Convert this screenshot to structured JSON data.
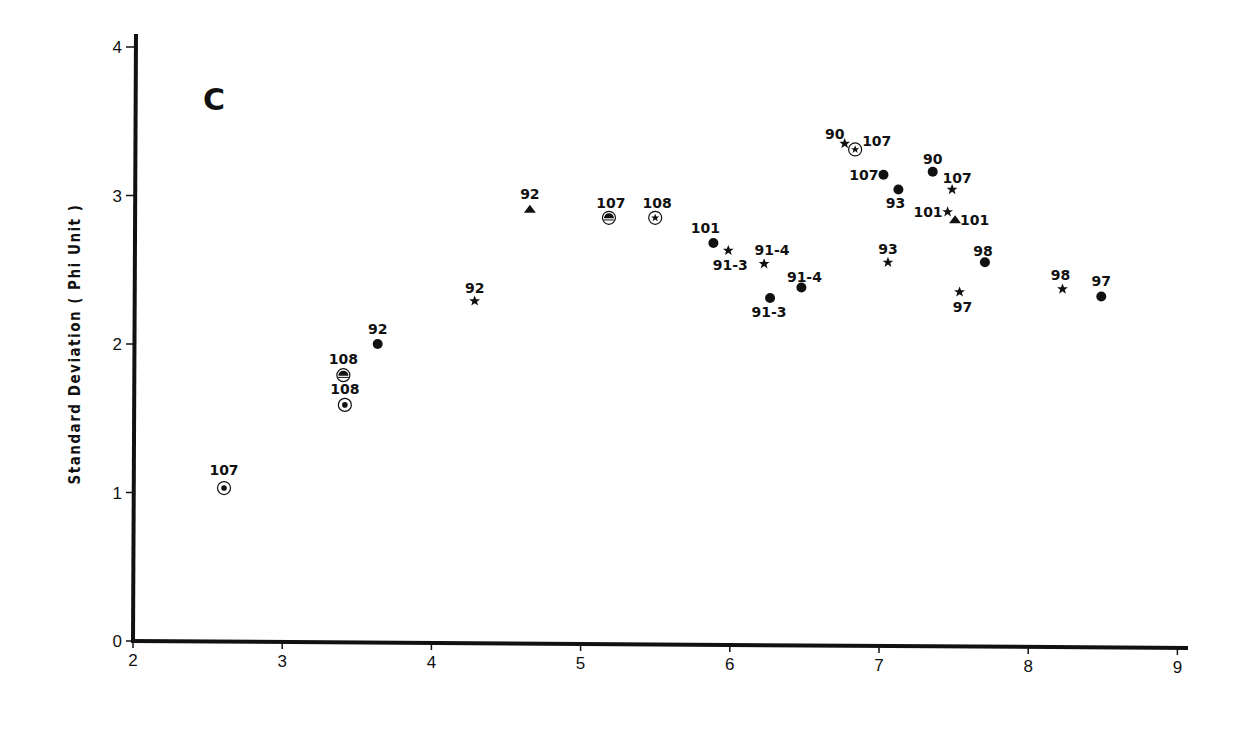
{
  "chart_data": {
    "type": "scatter",
    "title": "",
    "panel_label": "C",
    "xlabel": "",
    "ylabel": "Standard Deviation ( Phi Unit )",
    "xlim": [
      2,
      9
    ],
    "ylim": [
      0,
      4
    ],
    "x_ticks": [
      "2",
      "3",
      "4",
      "5",
      "6",
      "7",
      "8",
      "9"
    ],
    "y_ticks": [
      "0",
      "1",
      "2",
      "3",
      "4"
    ],
    "grid": false,
    "legend": null,
    "marker_types": {
      "dot": "filled circle",
      "star": "filled star",
      "triangle": "filled triangle",
      "ringed-dot": "dot inside open circle",
      "ringed-triangle": "triangle inside open circle",
      "ringed-star": "star inside open circle"
    },
    "points": [
      {
        "label": "107",
        "marker": "ringed-dot",
        "x": 2.61,
        "y": 1.03,
        "lx": 0,
        "ly": -13,
        "anchor": "middle"
      },
      {
        "label": "108",
        "marker": "ringed-triangle",
        "x": 3.41,
        "y": 1.79,
        "lx": 0,
        "ly": -11,
        "anchor": "middle"
      },
      {
        "label": "108",
        "marker": "ringed-dot",
        "x": 3.42,
        "y": 1.59,
        "lx": 0,
        "ly": -11,
        "anchor": "middle"
      },
      {
        "label": "92",
        "marker": "dot",
        "x": 3.64,
        "y": 2.0,
        "lx": 0,
        "ly": -10,
        "anchor": "middle"
      },
      {
        "label": "92",
        "marker": "star",
        "x": 4.29,
        "y": 2.29,
        "lx": 0,
        "ly": -8,
        "anchor": "middle"
      },
      {
        "label": "92",
        "marker": "triangle",
        "x": 4.66,
        "y": 2.91,
        "lx": 0,
        "ly": -10,
        "anchor": "middle"
      },
      {
        "label": "107",
        "marker": "ringed-triangle",
        "x": 5.19,
        "y": 2.85,
        "lx": 2,
        "ly": -10,
        "anchor": "middle"
      },
      {
        "label": "108",
        "marker": "ringed-star",
        "x": 5.5,
        "y": 2.85,
        "lx": 2,
        "ly": -10,
        "anchor": "middle"
      },
      {
        "label": "101",
        "marker": "dot",
        "x": 5.89,
        "y": 2.68,
        "lx": -8,
        "ly": -10,
        "anchor": "middle"
      },
      {
        "label": "91-3",
        "marker": "star",
        "x": 5.99,
        "y": 2.63,
        "lx": 2,
        "ly": 20,
        "anchor": "middle"
      },
      {
        "label": "91-4",
        "marker": "star",
        "x": 6.23,
        "y": 2.54,
        "lx": 8,
        "ly": -9,
        "anchor": "middle"
      },
      {
        "label": "91-3",
        "marker": "dot",
        "x": 6.27,
        "y": 2.31,
        "lx": -1,
        "ly": 19,
        "anchor": "middle"
      },
      {
        "label": "91-4",
        "marker": "dot",
        "x": 6.48,
        "y": 2.38,
        "lx": 3,
        "ly": -6,
        "anchor": "middle"
      },
      {
        "label": "90",
        "marker": "star",
        "x": 6.77,
        "y": 3.35,
        "lx": -10,
        "ly": -5,
        "anchor": "middle"
      },
      {
        "label": "107",
        "marker": "ringed-star",
        "x": 6.84,
        "y": 3.31,
        "lx": 7,
        "ly": -3,
        "anchor": "start"
      },
      {
        "label": "107",
        "marker": "dot",
        "x": 7.03,
        "y": 3.14,
        "lx": -5,
        "ly": 5,
        "anchor": "end"
      },
      {
        "label": "93",
        "marker": "dot",
        "x": 7.13,
        "y": 3.04,
        "lx": -3,
        "ly": 18,
        "anchor": "middle"
      },
      {
        "label": "93",
        "marker": "star",
        "x": 7.06,
        "y": 2.55,
        "lx": 0,
        "ly": -8,
        "anchor": "middle"
      },
      {
        "label": "90",
        "marker": "dot",
        "x": 7.36,
        "y": 3.16,
        "lx": 0,
        "ly": -8,
        "anchor": "middle"
      },
      {
        "label": "107",
        "marker": "star",
        "x": 7.49,
        "y": 3.04,
        "lx": 5,
        "ly": -7,
        "anchor": "middle"
      },
      {
        "label": "101",
        "marker": "star",
        "x": 7.46,
        "y": 2.89,
        "lx": -5,
        "ly": 5,
        "anchor": "end"
      },
      {
        "label": "101",
        "marker": "triangle",
        "x": 7.51,
        "y": 2.84,
        "lx": 5,
        "ly": 6,
        "anchor": "start"
      },
      {
        "label": "98",
        "marker": "dot",
        "x": 7.71,
        "y": 2.55,
        "lx": -2,
        "ly": -6,
        "anchor": "middle"
      },
      {
        "label": "97",
        "marker": "star",
        "x": 7.54,
        "y": 2.35,
        "lx": 3,
        "ly": 20,
        "anchor": "middle"
      },
      {
        "label": "98",
        "marker": "star",
        "x": 8.23,
        "y": 2.37,
        "lx": -2,
        "ly": -9,
        "anchor": "middle"
      },
      {
        "label": "97",
        "marker": "dot",
        "x": 8.49,
        "y": 2.32,
        "lx": 0,
        "ly": -10,
        "anchor": "middle"
      }
    ]
  }
}
